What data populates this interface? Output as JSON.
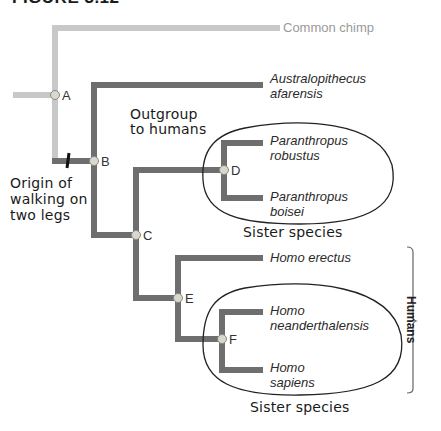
{
  "figure": {
    "title": "FIGURE 3.12"
  },
  "colors": {
    "outgroup_branch": "#c8c8c8",
    "hominin_branch": "#6e6e6e",
    "node_fill": "#d8d8cc",
    "ellipse_stroke": "#222222",
    "text_dark": "#2a2a2a",
    "text_light": "#9a9a9a"
  },
  "taxa": [
    {
      "id": "chimp",
      "line1": "Common chimp",
      "line2": ""
    },
    {
      "id": "afarensis",
      "line1": "Australopithecus",
      "line2": "afarensis"
    },
    {
      "id": "robustus",
      "line1": "Paranthropus",
      "line2": "robustus"
    },
    {
      "id": "boisei",
      "line1": "Paranthropus",
      "line2": "boisei"
    },
    {
      "id": "erectus",
      "line1": "Homo erectus",
      "line2": ""
    },
    {
      "id": "neanderthalensis",
      "line1": "Homo",
      "line2": "neanderthalensis"
    },
    {
      "id": "sapiens",
      "line1": "Homo",
      "line2": "sapiens"
    }
  ],
  "nodes": [
    {
      "id": "A",
      "label": "A"
    },
    {
      "id": "B",
      "label": "B"
    },
    {
      "id": "C",
      "label": "C"
    },
    {
      "id": "D",
      "label": "D"
    },
    {
      "id": "E",
      "label": "E"
    },
    {
      "id": "F",
      "label": "F"
    }
  ],
  "annotations": {
    "outgroup": {
      "line1": "Outgroup",
      "line2": "to humans"
    },
    "origin": {
      "line1": "Origin of",
      "line2": "walking on",
      "line3": "two legs"
    },
    "sister_upper": "Sister species",
    "sister_lower": "Sister species",
    "humans_bracket": "Humans"
  }
}
